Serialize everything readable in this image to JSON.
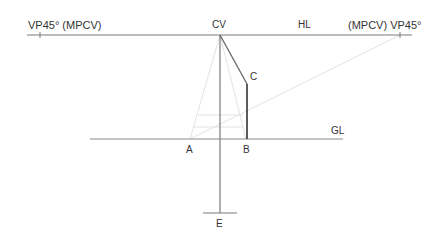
{
  "diagram": {
    "labels": {
      "vp_left": "VP45° (MPCV)",
      "vp_right": "(MPCV) VP45°",
      "cv": "CV",
      "hl": "HL",
      "gl": "GL",
      "a": "A",
      "b": "B",
      "c": "C",
      "e": "E"
    },
    "colors": {
      "main_line": "#777777",
      "bold_line": "#444444",
      "faint_line": "#e2e2e2",
      "text": "#333333"
    }
  }
}
